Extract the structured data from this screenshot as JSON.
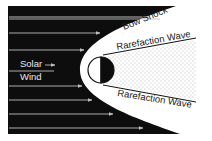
{
  "diagram": {
    "title": "",
    "labels": {
      "solar_wind_line1": "Solar",
      "solar_wind_line2": "Wind",
      "bow_shock": "Bow Shock",
      "rarefaction_upper": "Rarefaction Wave",
      "rarefaction_lower": "Rarefaction Wave"
    },
    "elements": [
      {
        "id": "solar-wind-region",
        "description": "black field of solar wind flow with horizontal arrows"
      },
      {
        "id": "bow-shock",
        "description": "parabolic boundary around obstacle"
      },
      {
        "id": "obstacle",
        "description": "circular body, left half lit (white), right half dark"
      },
      {
        "id": "wake",
        "description": "stippled rarefied wake region behind obstacle"
      },
      {
        "id": "rarefaction-waves",
        "description": "two diagonal lines bounding the wake"
      }
    ],
    "colors": {
      "background": "#ffffff",
      "solar_wind": "#0d0d0d",
      "flow_lines": "#bdbdbd",
      "outline": "#111111",
      "wake_dots": "#6a6a6a"
    }
  }
}
